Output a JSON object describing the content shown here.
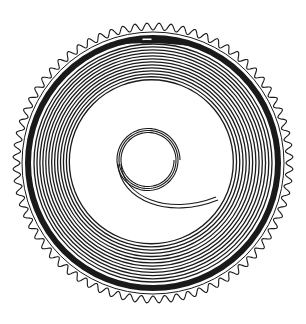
{
  "figure": {
    "background": "#ffffff",
    "stroke_color": "#1a1a1a",
    "center": [
      153,
      163
    ],
    "gear": {
      "tooth_count": 72,
      "outer_radius": 140,
      "root_radius": 133
    },
    "barrel_wall": {
      "inner_radius": 122,
      "outer_radius": 128
    },
    "spring": {
      "outer_radius": 119,
      "inner_radius": 82,
      "coils": 13
    },
    "arbor_coil": {
      "center": [
        148,
        160
      ],
      "radius": 30,
      "turns": 3
    }
  }
}
